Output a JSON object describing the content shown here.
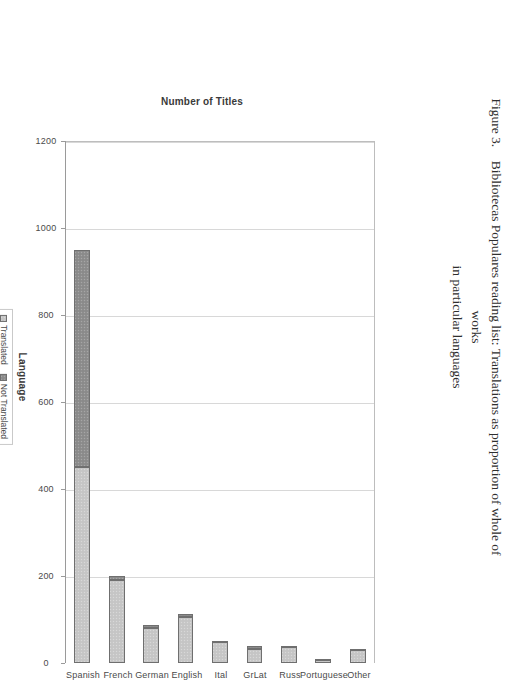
{
  "caption": {
    "figure_number": "Figure 3.",
    "line1": "Bibliotecas Populares reading list:  Translations as proportion of whole of works",
    "line2": "in particular languages"
  },
  "legend": {
    "items": [
      {
        "label": "Translated",
        "color": "#c7c7c7"
      },
      {
        "label": "Not Translated",
        "color": "#8e8e8e"
      }
    ]
  },
  "chart_data": {
    "type": "bar",
    "orientation": "horizontal",
    "stacked": true,
    "rotated_on_page": true,
    "title": "",
    "xlabel": "Language",
    "ylabel": "Number of Titles",
    "ylim": [
      0,
      1200
    ],
    "yticks": [
      0,
      200,
      400,
      600,
      800,
      1000,
      1200
    ],
    "ytick_labels": [
      "0",
      "200",
      "400",
      "600",
      "800",
      "1000",
      "1200"
    ],
    "grid": true,
    "grid_axis": "value",
    "legend_position": "below-axis",
    "categories": [
      "Spanish",
      "French",
      "German",
      "English",
      "Ital",
      "GrLat",
      "Russ",
      "Portuguese",
      "Other"
    ],
    "series": [
      {
        "name": "Translated",
        "color": "#c7c7c7",
        "values": [
          450,
          190,
          80,
          105,
          48,
          33,
          36,
          8,
          30
        ]
      },
      {
        "name": "Not Translated",
        "color": "#8e8e8e",
        "values": [
          500,
          10,
          8,
          8,
          2,
          6,
          4,
          2,
          3
        ]
      }
    ],
    "totals": [
      950,
      200,
      88,
      113,
      50,
      39,
      40,
      10,
      33
    ]
  },
  "axis": {
    "value_title": "Number of Titles",
    "category_title": "Language"
  }
}
